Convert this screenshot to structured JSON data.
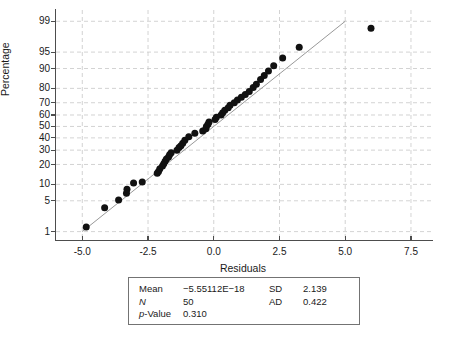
{
  "chart_data": {
    "type": "scatter",
    "title": "",
    "subtitle": "",
    "xlabel": "Residuals",
    "ylabel": "Percentage",
    "xlim": [
      -6.0,
      8.3
    ],
    "ylim_percent": [
      0.6,
      99.5
    ],
    "grid": true,
    "legend_position": "none",
    "xticks": [
      -5.0,
      -2.5,
      0.0,
      2.5,
      5.0,
      7.5
    ],
    "xticklabels": [
      "-5.0",
      "-2.5",
      "0.0",
      "2.5",
      "5.0",
      "7.5"
    ],
    "yticks": [
      1,
      5,
      10,
      20,
      30,
      40,
      50,
      60,
      70,
      80,
      90,
      95,
      99
    ],
    "yticklabels": [
      "1",
      "5",
      "10",
      "20",
      "30",
      "40",
      "50",
      "60",
      "70",
      "80",
      "90",
      "95",
      "99"
    ],
    "marker_color": "#111111",
    "line_color": "#8c8c8c",
    "grid_color": "#c8c8c8",
    "series": [
      {
        "name": "residuals",
        "x": [
          -4.85,
          -4.15,
          -3.62,
          -3.32,
          -3.3,
          -3.05,
          -2.72,
          -2.15,
          -2.1,
          -2.05,
          -1.95,
          -1.9,
          -1.85,
          -1.8,
          -1.72,
          -1.68,
          -1.62,
          -1.4,
          -1.32,
          -1.25,
          -1.18,
          -1.1,
          -0.95,
          -0.72,
          -0.42,
          -0.3,
          -0.28,
          -0.22,
          -0.18,
          0.05,
          0.1,
          0.28,
          0.34,
          0.42,
          0.55,
          0.62,
          0.78,
          0.9,
          1.05,
          1.2,
          1.35,
          1.5,
          1.62,
          1.78,
          1.92,
          2.08,
          2.28,
          2.62,
          3.25,
          5.98
        ],
        "percentile": [
          1.3,
          3.6,
          5.2,
          7.0,
          8.2,
          10.5,
          11.0,
          15.0,
          16.0,
          17.5,
          19.0,
          20.5,
          22.0,
          23.5,
          25.0,
          26.5,
          28.0,
          30.0,
          32.0,
          33.5,
          35.5,
          38.0,
          41.0,
          44.0,
          46.0,
          48.0,
          50.0,
          52.0,
          54.0,
          56.0,
          58.0,
          60.0,
          62.0,
          64.0,
          66.0,
          68.0,
          70.0,
          72.0,
          74.0,
          76.0,
          78.0,
          80.5,
          82.5,
          85.0,
          87.0,
          89.0,
          91.0,
          93.5,
          96.0,
          98.5
        ]
      }
    ],
    "fit_line": {
      "x_start": -5.0,
      "y_start_percent": 1.0,
      "x_end": 5.0,
      "y_end_percent": 99.0
    }
  },
  "axis": {
    "ylabel": "Percentage",
    "xlabel": "Residuals"
  },
  "stats": {
    "rows": [
      {
        "key1": "Mean",
        "value1": "−5.55112E−18",
        "key2": "SD",
        "value2": "2.139"
      },
      {
        "key1": "N",
        "value1": "50",
        "key2": "AD",
        "value2": "0.422"
      },
      {
        "key1": "p-Value",
        "value1": "0.310",
        "key2": "",
        "value2": ""
      }
    ]
  }
}
